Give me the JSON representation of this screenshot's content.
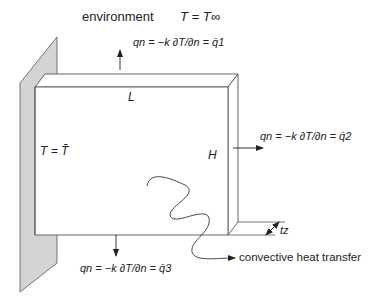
{
  "environment": {
    "label": "environment",
    "condition": "T = T∞"
  },
  "plate": {
    "length_label": "L",
    "height_label": "H",
    "thickness_label": "tz",
    "fixed_boundary": "T = T̄"
  },
  "boundaries": [
    {
      "id": "q1",
      "equation": "qn = −k ∂T/∂n = q̄1",
      "side": "top"
    },
    {
      "id": "q2",
      "equation": "qn = −k ∂T/∂n = q̄2",
      "side": "right"
    },
    {
      "id": "q3",
      "equation": "qn = −k ∂T/∂n = q̄3",
      "side": "bottom"
    }
  ],
  "annotations": {
    "convective": "convective heat transfer"
  },
  "colors": {
    "wall_fill": "#d4d4d4",
    "line": "#444444"
  }
}
